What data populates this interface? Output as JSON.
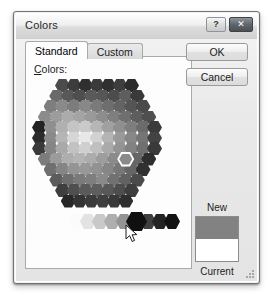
{
  "dialog": {
    "title": "Colors",
    "caption_buttons": [
      {
        "name": "help-button",
        "glyph": "?"
      },
      {
        "name": "close-button",
        "glyph": "✕"
      }
    ]
  },
  "tabs": [
    {
      "label": "Standard",
      "active": true
    },
    {
      "label": "Custom",
      "active": false
    }
  ],
  "panel": {
    "colors_label_accel": "C",
    "colors_label_rest": "olors:"
  },
  "buttons": {
    "ok_label": "OK",
    "cancel_label": "Cancel"
  },
  "preview": {
    "new_label": "New",
    "current_label": "Current",
    "new_color": "#828282",
    "current_color": "#ffffff"
  },
  "palette": {
    "selected_color": "#8a8a8a",
    "gray_strip": [
      "#fbfbfb",
      "#e3e3e3",
      "#c9c9c9",
      "#aeaeae",
      "#949494",
      "#6e6e6e",
      "#3f3f3f",
      "#232323",
      "#121212"
    ],
    "black_swatch": "#101010",
    "honeycomb_rows": [
      [
        "#4b4b4b",
        "#3c3c3c",
        "#2f2f2f",
        "#3a3a3a",
        "#303030",
        "#3d3d3d",
        "#2b2b2b"
      ],
      [
        "#6a6a6a",
        "#585858",
        "#4e4e4e",
        "#5a5a5a",
        "#565656",
        "#4c4c4c",
        "#5e5e5e",
        "#3a3a3a"
      ],
      [
        "#7e7e7e",
        "#8a8a8a",
        "#7c7c7c",
        "#888888",
        "#7a7a7a",
        "#6e6e6e",
        "#636363",
        "#555555",
        "#4a4a4a"
      ],
      [
        "#8c8c8c",
        "#9c9c9c",
        "#ababab",
        "#a4a4a4",
        "#9a9a9a",
        "#8d8d8d",
        "#7f7f7f",
        "#6f6f6f",
        "#5d5d5d",
        "#4f4f4f"
      ],
      [
        "#232323",
        "#8f8f8f",
        "#b0b0b0",
        "#c4c4c4",
        "#cacaca",
        "#b6b6b6",
        "#a0a0a0",
        "#8f8f8f",
        "#7e7e7e",
        "#6b6b6b",
        "#3b3b3b"
      ],
      [
        "#2c2c2c",
        "#8a8a8a",
        "#b5b5b5",
        "#d6d6d6",
        "#e8e8e8",
        "#d2d2d2",
        "#b4b4b4",
        "#9a9a9a",
        "#878787",
        "#757575",
        "#434343"
      ],
      [
        "#3a3a3a",
        "#858585",
        "#a9a9a9",
        "#c2c2c2",
        "#cfcfcf",
        "#c0c0c0",
        "#aaaaaa",
        "#949494",
        "#828282",
        "#6f6f6f",
        "#3a3a3a"
      ],
      [
        "#7c7c7c",
        "#9b9b9b",
        "#aeaeae",
        "#b4b4b4",
        "#acacac",
        "#9d9d9d",
        "#8b8b8b",
        "#7a7a7a",
        "#666666",
        "#2e2e2e"
      ],
      [
        "#6f6f6f",
        "#858585",
        "#949494",
        "#989898",
        "#929292",
        "#868686",
        "#777777",
        "#656565",
        "#313131"
      ],
      [
        "#5c5c5c",
        "#6e6e6e",
        "#7a7a7a",
        "#7e7e7e",
        "#8a8a8a",
        "#717171",
        "#626262",
        "#4a4a4a"
      ],
      [
        "#3f3f3f",
        "#4f4f4f",
        "#5a5a5a",
        "#5e5e5e",
        "#585858",
        "#4d4d4d",
        "#3e3e3e"
      ],
      [
        "#272727",
        "#333333",
        "#3b3b3b",
        "#3f3f3f",
        "#393939",
        "#2e2e2e"
      ]
    ]
  }
}
